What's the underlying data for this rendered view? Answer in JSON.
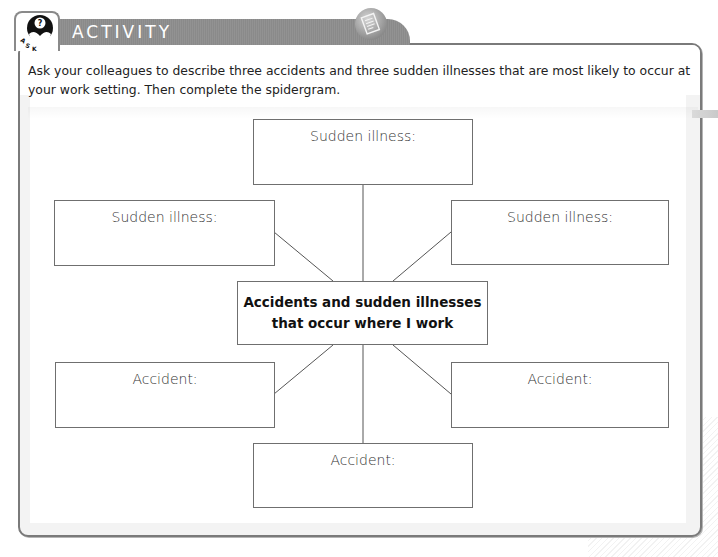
{
  "header": {
    "title": "ACTIVITY",
    "ask_icon": "ask-question-icon",
    "ask_letters": [
      "A",
      "S",
      "K"
    ],
    "doc_icon": "document-icon"
  },
  "instructions": "Ask your colleagues to describe three accidents and three sudden illnesses that are most likely to occur at your work setting. Then complete the spidergram.",
  "spidergram": {
    "center": {
      "label": "Accidents and sudden illnesses\nthat occur where I work"
    },
    "nodes": [
      {
        "position": "top",
        "label": "Sudden illness:",
        "value": ""
      },
      {
        "position": "upper-left",
        "label": "Sudden illness:",
        "value": ""
      },
      {
        "position": "upper-right",
        "label": "Sudden illness:",
        "value": ""
      },
      {
        "position": "lower-left",
        "label": "Accident:",
        "value": ""
      },
      {
        "position": "lower-right",
        "label": "Accident:",
        "value": ""
      },
      {
        "position": "bottom",
        "label": "Accident:",
        "value": ""
      }
    ]
  },
  "colors": {
    "header_tab": "#8e8e8e",
    "frame_border": "#7a7a7a",
    "box_border": "#6f6f6f",
    "line": "#555555"
  }
}
